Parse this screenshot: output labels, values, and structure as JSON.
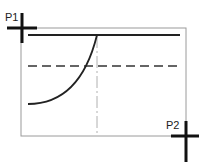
{
  "diagram": {
    "points": [
      {
        "label": "P1",
        "x": 22,
        "y": 28
      },
      {
        "label": "P2",
        "x": 186,
        "y": 136
      }
    ],
    "colors": {
      "frame": "#9a9a9a",
      "line": "#222222",
      "centerline": "#b0b0b0"
    }
  }
}
